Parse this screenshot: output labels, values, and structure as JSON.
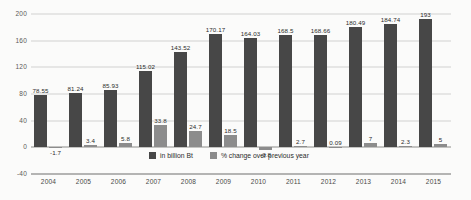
{
  "chart_data": {
    "type": "bar",
    "title": "",
    "xlabel": "",
    "ylabel": "",
    "ylim": [
      -40,
      200
    ],
    "yticks": [
      200,
      160,
      120,
      80,
      40,
      0,
      -40
    ],
    "grid": true,
    "legend_position": "inside-bottom-center",
    "categories": [
      "2004",
      "2005",
      "2006",
      "2007",
      "2008",
      "2009",
      "2010",
      "2011",
      "2012",
      "2013",
      "2014",
      "2015"
    ],
    "series": [
      {
        "name": "in billion Bt",
        "color": "#474747",
        "values": [
          78.55,
          81.24,
          85.93,
          115.02,
          143.52,
          170.17,
          164.03,
          168.5,
          168.66,
          180.49,
          184.74,
          193
        ],
        "labels": [
          "78.55",
          "81.24",
          "85.93",
          "115.02",
          "143.52",
          "170.17",
          "164.03",
          "168.5",
          "168.66",
          "180.49",
          "184.74",
          "193"
        ]
      },
      {
        "name": "% change over previous year",
        "color": "#8c8c8c",
        "values": [
          -1.7,
          3.4,
          5.8,
          33.8,
          24.7,
          18.5,
          -3.8,
          2.7,
          0.09,
          7,
          2.3,
          5
        ],
        "labels": [
          "-1.7",
          "3.4",
          "5.8",
          "33.8",
          "24.7",
          "18.5",
          "-3.8",
          "2.7",
          "0.09",
          "7",
          "2.3",
          "5"
        ]
      }
    ]
  }
}
